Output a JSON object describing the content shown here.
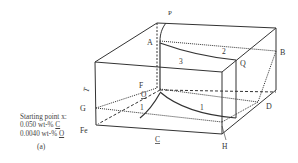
{
  "figure": {
    "panel_label": "(a)",
    "starting_point": {
      "title": "Starting point x:",
      "line1_value": "0.050  wt-% ",
      "line1_element": "C",
      "line2_value": "0.0040 wt-% ",
      "line2_element": "O"
    },
    "axis_labels": {
      "temperature": "T",
      "carbon": "C",
      "origin": "Fe",
      "oxygen": "O"
    },
    "point_labels": {
      "P": "P",
      "A": "A",
      "B": "B",
      "Q": "Q",
      "F": "F",
      "G": "G",
      "D": "D",
      "H": "H"
    },
    "region_labels": {
      "top_left": "3",
      "top_right": "2",
      "bottom_left": "1",
      "bottom_right": "1"
    }
  }
}
